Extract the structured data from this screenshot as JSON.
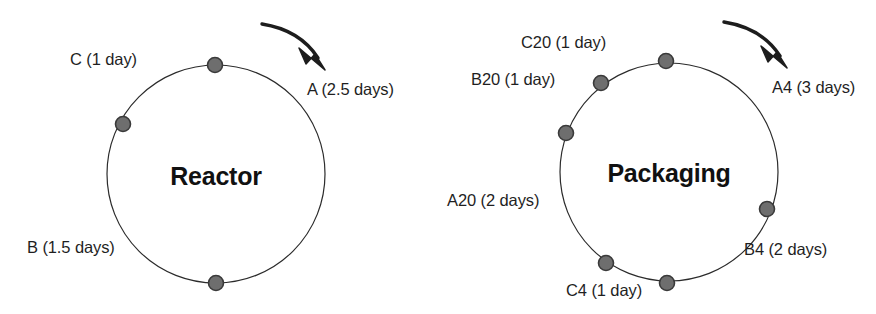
{
  "figure": {
    "background_color": "#ffffff",
    "line_color": "#2b2b2b",
    "dot_fill_color": "#6e6e6e",
    "dot_stroke_color": "#3a3a3a",
    "text_color": "#1f1f1f"
  },
  "diagrams": [
    {
      "id": "reactor",
      "title": "Reactor",
      "title_x": 216,
      "title_y": 176,
      "center_x": 216,
      "center_y": 174,
      "radius": 109,
      "arrow": {
        "name": "clockwise-rotation-arrow",
        "start_x": 262,
        "start_y": 24,
        "control_x": 300,
        "control_y": 30,
        "end_x": 318,
        "end_y": 58,
        "tip_x": 325,
        "tip_y": 70
      },
      "nodes": [
        {
          "label": "C (1 day)",
          "product": "C",
          "duration": "1 day",
          "dot_x": 215,
          "dot_y": 65,
          "label_x": 70,
          "label_y": 50,
          "label_align": "left"
        },
        {
          "label": "B (1.5 days)",
          "product": "B",
          "duration": "1.5 days",
          "dot_x": 123,
          "dot_y": 124,
          "label_x": 27,
          "label_y": 238,
          "label_align": "left"
        },
        {
          "label": "A (2.5 days)",
          "product": "A",
          "duration": "2.5 days",
          "dot_x": 216,
          "dot_y": 283,
          "label_x": 307,
          "label_y": 80,
          "label_align": "left"
        }
      ]
    },
    {
      "id": "packaging",
      "title": "Packaging",
      "title_x": 669,
      "title_y": 173,
      "center_x": 669,
      "center_y": 172,
      "radius": 109,
      "arrow": {
        "name": "clockwise-rotation-arrow",
        "start_x": 724,
        "start_y": 22,
        "control_x": 762,
        "control_y": 28,
        "end_x": 780,
        "end_y": 56,
        "tip_x": 787,
        "tip_y": 68
      },
      "nodes": [
        {
          "label": "C20 (1 day)",
          "product": "C20",
          "duration": "1 day",
          "dot_x": 666,
          "dot_y": 61,
          "label_x": 521,
          "label_y": 33,
          "label_align": "left"
        },
        {
          "label": "B20 (1 day)",
          "product": "B20",
          "duration": "1 day",
          "dot_x": 601,
          "dot_y": 83,
          "label_x": 471,
          "label_y": 70,
          "label_align": "left"
        },
        {
          "label": "A20 (2 days)",
          "product": "A20",
          "duration": "2 days",
          "dot_x": 566,
          "dot_y": 133,
          "label_x": 447,
          "label_y": 191,
          "label_align": "left"
        },
        {
          "label": "A4 (3 days)",
          "product": "A4",
          "duration": "3 days",
          "dot_x": 667,
          "dot_y": 283,
          "label_x": 772,
          "label_y": 78,
          "label_align": "left"
        },
        {
          "label": "B4 (2 days)",
          "product": "B4",
          "duration": "2 days",
          "dot_x": 767,
          "dot_y": 209,
          "label_x": 744,
          "label_y": 240,
          "label_align": "left"
        },
        {
          "label": "C4 (1 day)",
          "product": "C4",
          "duration": "1 day",
          "dot_x": 606,
          "dot_y": 263,
          "label_x": 566,
          "label_y": 281,
          "label_align": "left"
        }
      ]
    }
  ]
}
